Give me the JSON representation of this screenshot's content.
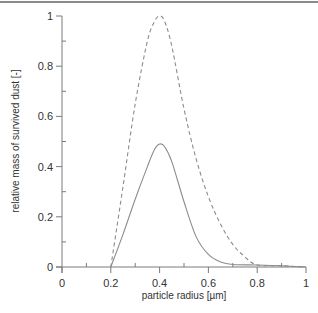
{
  "chart_data": {
    "type": "line",
    "title": "",
    "xlabel": "particle radius [µm]",
    "ylabel": "relative mass of survived dust [-]",
    "xlim": [
      0,
      1
    ],
    "ylim": [
      0,
      1
    ],
    "x_ticks": [
      "0",
      "0.2",
      "0.4",
      "0.6",
      "0.8",
      "1"
    ],
    "y_ticks": [
      "0",
      "0.2",
      "0.4",
      "0.6",
      "0.8",
      "1"
    ],
    "grid": false,
    "legend": null,
    "series": [
      {
        "name": "solid",
        "style": "solid",
        "color": "#8c8c8c",
        "x": [
          0.2,
          0.25,
          0.3,
          0.35,
          0.38,
          0.4,
          0.42,
          0.45,
          0.5,
          0.55,
          0.6,
          0.65,
          0.7,
          0.8,
          0.9,
          1.0
        ],
        "y": [
          0.0,
          0.13,
          0.27,
          0.4,
          0.47,
          0.49,
          0.48,
          0.42,
          0.26,
          0.12,
          0.05,
          0.02,
          0.01,
          0.008,
          0.005,
          0.0
        ]
      },
      {
        "name": "dashed",
        "style": "dashed",
        "color": "#8c8c8c",
        "x": [
          0.2,
          0.25,
          0.3,
          0.35,
          0.38,
          0.4,
          0.42,
          0.45,
          0.5,
          0.55,
          0.6,
          0.65,
          0.7,
          0.75,
          0.8,
          0.9,
          1.0
        ],
        "y": [
          0.0,
          0.32,
          0.65,
          0.9,
          0.98,
          1.0,
          0.98,
          0.88,
          0.63,
          0.43,
          0.28,
          0.17,
          0.09,
          0.04,
          0.008,
          0.005,
          0.0
        ]
      }
    ]
  }
}
